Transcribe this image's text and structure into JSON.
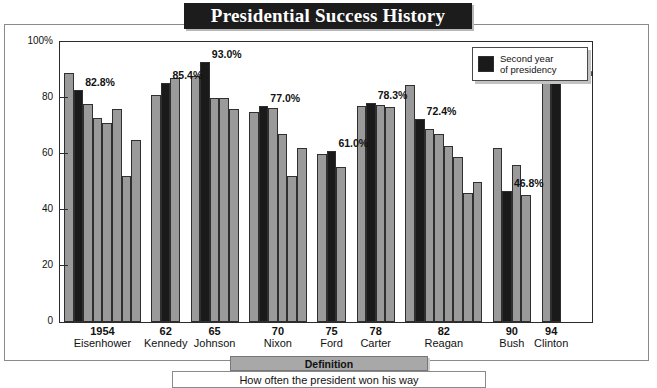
{
  "title": "Presidential Success History",
  "legend": {
    "swatch_name": "dark-square-swatch",
    "line1": "Second year",
    "line2": "of presidency"
  },
  "footer": {
    "tab_label": "Definition",
    "body_text": "How often the president won his way"
  },
  "axis": {
    "y_ticks": [
      "100%",
      "80",
      "60",
      "40",
      "20",
      "0"
    ],
    "y_values": [
      100,
      80,
      60,
      40,
      20,
      0
    ]
  },
  "chart_data": {
    "type": "bar",
    "title": "Presidential Success History",
    "subtitle": "How often the president won his way",
    "xlabel": "",
    "ylabel": "",
    "ylim": [
      0,
      100
    ],
    "ytick_labels": [
      "0",
      "20",
      "40",
      "60",
      "80",
      "100%"
    ],
    "grid": false,
    "legend_position": "top-right",
    "legend_entries": [
      "Second year of presidency"
    ],
    "highlight_rule": "second bar of each group is the president's second year in office",
    "categories": [
      "Eisenhower",
      "Kennedy",
      "Johnson",
      "Nixon",
      "Ford",
      "Carter",
      "Reagan",
      "Bush",
      "Clinton"
    ],
    "category_start_years": [
      "1954",
      "62",
      "65",
      "70",
      "75",
      "78",
      "82",
      "90",
      "94"
    ],
    "groups": [
      {
        "president": "Eisenhower",
        "start_year": "1954",
        "highlight_index": 1,
        "highlight_value": 82.8,
        "highlight_label": "82.8%",
        "values": [
          89.0,
          82.8,
          78.0,
          73.0,
          71.0,
          76.0,
          52.0,
          65.0
        ]
      },
      {
        "president": "Kennedy",
        "start_year": "62",
        "highlight_index": 1,
        "highlight_value": 85.4,
        "highlight_label": "85.4%",
        "values": [
          81.0,
          85.4,
          87.0
        ]
      },
      {
        "president": "Johnson",
        "start_year": "65",
        "highlight_index": 1,
        "highlight_value": 93.0,
        "highlight_label": "93.0%",
        "values": [
          88.0,
          93.0,
          80.0,
          80.0,
          76.0
        ]
      },
      {
        "president": "Nixon",
        "start_year": "70",
        "highlight_index": 1,
        "highlight_value": 77.0,
        "highlight_label": "77.0%",
        "values": [
          75.0,
          77.0,
          76.5,
          67.0,
          52.0,
          62.0
        ]
      },
      {
        "president": "Ford",
        "start_year": "75",
        "highlight_index": 1,
        "highlight_value": 61.0,
        "highlight_label": "61.0%",
        "values": [
          60.0,
          61.0,
          55.5
        ]
      },
      {
        "president": "Carter",
        "start_year": "78",
        "highlight_index": 1,
        "highlight_value": 78.3,
        "highlight_label": "78.3%",
        "values": [
          77.0,
          78.3,
          77.5,
          76.8
        ]
      },
      {
        "president": "Reagan",
        "start_year": "82",
        "highlight_index": 1,
        "highlight_value": 72.4,
        "highlight_label": "72.4%",
        "values": [
          84.5,
          72.4,
          69.0,
          67.0,
          63.0,
          59.0,
          46.0,
          50.0
        ]
      },
      {
        "president": "Bush",
        "start_year": "90",
        "highlight_index": 1,
        "highlight_value": 46.8,
        "highlight_label": "46.8%",
        "values": [
          62.0,
          46.8,
          56.0,
          45.5
        ]
      },
      {
        "president": "Clinton",
        "start_year": "94",
        "highlight_index": 1,
        "highlight_value": 86.4,
        "highlight_label": "86.4%",
        "values": [
          86.0,
          86.4
        ]
      }
    ],
    "colors": {
      "bar_light": "#9a9a9a",
      "bar_dark": "#1a1a1a",
      "bar_border": "#2f2f2f",
      "title_bg": "#1c1c1c",
      "title_fg": "#ffffff",
      "plot_bg": "#ffffff",
      "axis": "#2b2b2b"
    }
  }
}
